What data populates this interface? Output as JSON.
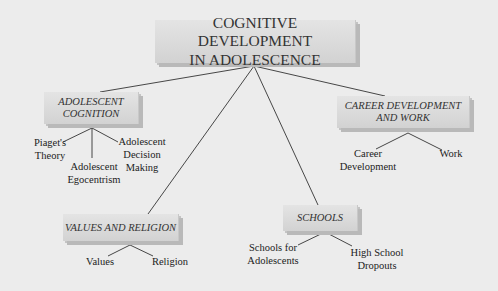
{
  "diagram": {
    "root": {
      "line1": "COGNITIVE DEVELOPMENT",
      "line2": "IN ADOLESCENCE"
    },
    "branches": [
      {
        "label_line1": "ADOLESCENT",
        "label_line2": "COGNITION",
        "children": [
          {
            "line1": "Piaget's",
            "line2": "Theory"
          },
          {
            "line1": "Adolescent",
            "line2": "Egocentrism"
          },
          {
            "line1": "Adolescent",
            "line2": "Decision",
            "line3": "Making"
          }
        ]
      },
      {
        "label": "VALUES AND RELIGION",
        "children": [
          {
            "line1": "Values"
          },
          {
            "line1": "Religion"
          }
        ]
      },
      {
        "label": "SCHOOLS",
        "children": [
          {
            "line1": "Schools for",
            "line2": "Adolescents"
          },
          {
            "line1": "High School",
            "line2": "Dropouts"
          }
        ]
      },
      {
        "label_line1": "CAREER DEVELOPMENT",
        "label_line2": "AND WORK",
        "children": [
          {
            "line1": "Career",
            "line2": "Development"
          },
          {
            "line1": "Work"
          }
        ]
      }
    ]
  },
  "colors": {
    "background": "#ececec",
    "box": "#dadada",
    "line": "#333333"
  }
}
